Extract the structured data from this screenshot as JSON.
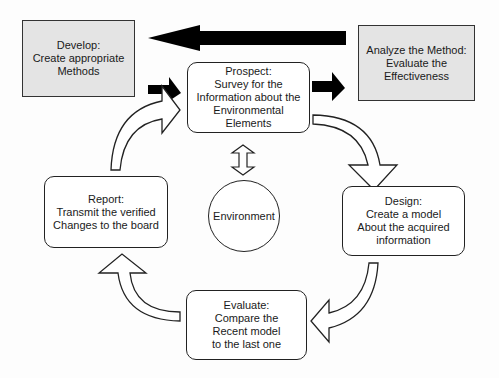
{
  "diagram": {
    "type": "cycle-process",
    "colors": {
      "outside_box_fill": "#e4e4e4",
      "border": "#222222",
      "solid_arrow": "#000000",
      "hollow_arrow_fill": "#ffffff"
    },
    "outside_boxes": {
      "develop": {
        "title": "Develop:",
        "lines": [
          "Create appropriate",
          "Methods"
        ]
      },
      "analyze": {
        "title": "Analyze the Method:",
        "lines": [
          "Evaluate the",
          "Effectiveness"
        ]
      }
    },
    "cycle_nodes": {
      "prospect": {
        "title": "Prospect:",
        "lines": [
          "Survey for the",
          "Information about the",
          "Environmental",
          "Elements"
        ]
      },
      "design": {
        "title": "Design:",
        "lines": [
          "Create a model",
          "About the acquired",
          "information"
        ]
      },
      "evaluate": {
        "title": "Evaluate:",
        "lines": [
          "Compare the",
          "Recent model",
          "to the last one"
        ]
      },
      "report": {
        "title": "Report:",
        "lines": [
          "Transmit the verified",
          "Changes to the board"
        ]
      }
    },
    "center": {
      "label": "Environment"
    },
    "arrows": [
      {
        "from": "analyze",
        "to": "develop",
        "style": "solid-large"
      },
      {
        "from": "develop",
        "to": "prospect",
        "style": "solid-small"
      },
      {
        "from": "prospect",
        "to": "analyze",
        "style": "solid-small"
      },
      {
        "from": "prospect",
        "to": "design",
        "style": "hollow-curved"
      },
      {
        "from": "design",
        "to": "evaluate",
        "style": "hollow-curved"
      },
      {
        "from": "evaluate",
        "to": "report",
        "style": "hollow-curved"
      },
      {
        "from": "report",
        "to": "prospect",
        "style": "hollow-curved"
      },
      {
        "from": "prospect",
        "to": "environment",
        "style": "hollow-double"
      }
    ]
  }
}
